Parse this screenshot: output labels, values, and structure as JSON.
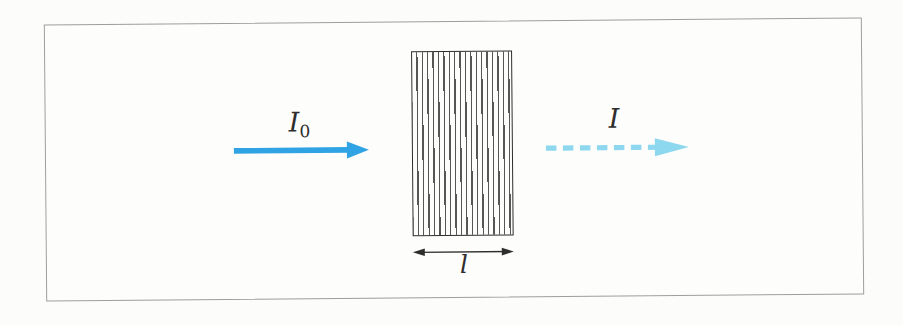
{
  "figure": {
    "frame": {
      "border_color": "#9e9e9e",
      "background": "#fdfdfb"
    },
    "labels": {
      "incident_base": "I",
      "incident_sub": "0",
      "transmitted": "I",
      "thickness": "l"
    },
    "colors": {
      "incident_arrow": "#2fa3e4",
      "transmitted_arrow": "#8dd8ee",
      "slab_outline": "#2e2e2e",
      "slab_hatch": "#565656",
      "dimension_arrow": "#2e2e2e",
      "label_text": "#2e2e2e"
    }
  }
}
